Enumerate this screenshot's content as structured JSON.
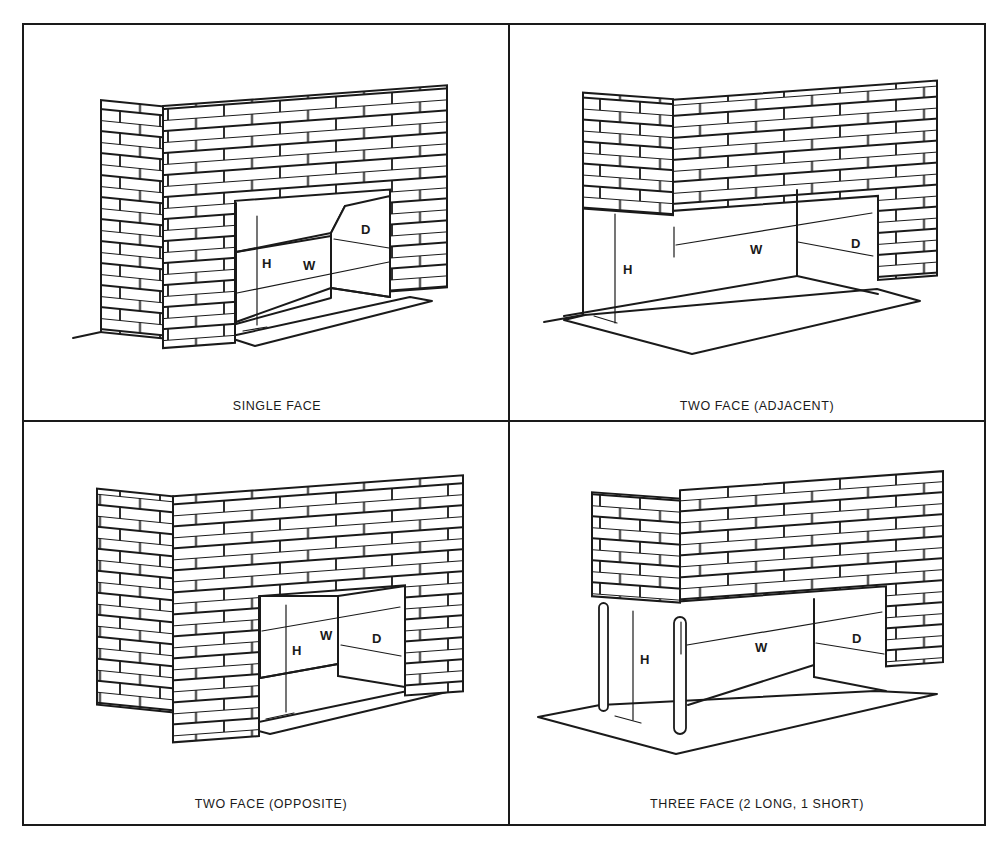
{
  "figure": {
    "layout": "2x2 grid",
    "panels": [
      {
        "id": "single-face",
        "caption": "SINGLE FACE",
        "dimensions": {
          "height": "H",
          "width": "W",
          "depth": "D"
        }
      },
      {
        "id": "two-face-adjacent",
        "caption": "TWO FACE (ADJACENT)",
        "dimensions": {
          "height": "H",
          "width": "W",
          "depth": "D"
        }
      },
      {
        "id": "two-face-opposite",
        "caption": "TWO FACE (OPPOSITE)",
        "dimensions": {
          "height": "H",
          "width": "W",
          "depth": "D"
        }
      },
      {
        "id": "three-face",
        "caption": "THREE FACE (2 LONG, 1 SHORT)",
        "dimensions": {
          "height": "H",
          "width": "W",
          "depth": "D"
        }
      }
    ]
  },
  "colors": {
    "ink": "#1a1a1a",
    "paper": "#ffffff"
  }
}
